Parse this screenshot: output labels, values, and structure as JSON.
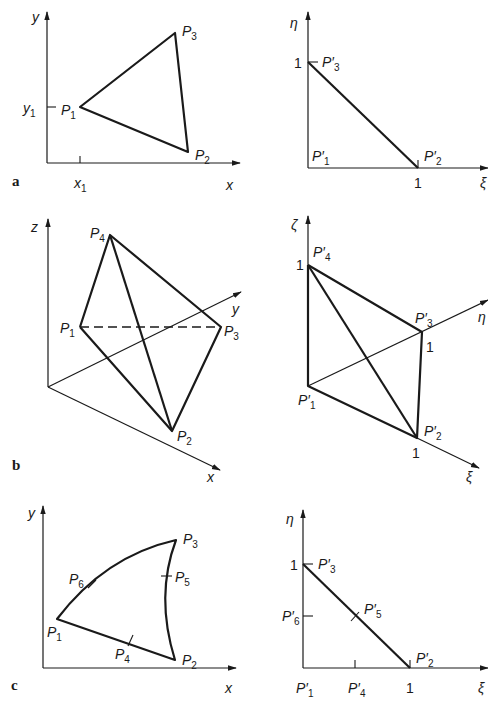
{
  "figure": {
    "panels": [
      {
        "id": "a",
        "label": "a",
        "left": {
          "axes": {
            "x": "x",
            "y": "y"
          },
          "ticks": {
            "x1": "x",
            "x1_sub": "1",
            "y1": "y",
            "y1_sub": "1"
          },
          "points": [
            {
              "name": "P",
              "sub": "1"
            },
            {
              "name": "P",
              "sub": "2"
            },
            {
              "name": "P",
              "sub": "3"
            }
          ]
        },
        "right": {
          "axes": {
            "xi": "ξ",
            "eta": "η"
          },
          "ticks": {
            "xi_one": "1",
            "eta_one": "1"
          },
          "points": [
            {
              "name": "P′",
              "sub": "1"
            },
            {
              "name": "P′",
              "sub": "2"
            },
            {
              "name": "P′",
              "sub": "3"
            }
          ]
        }
      },
      {
        "id": "b",
        "label": "b",
        "left": {
          "axes": {
            "x": "x",
            "y": "y",
            "z": "z"
          },
          "points": [
            {
              "name": "P",
              "sub": "1"
            },
            {
              "name": "P",
              "sub": "2"
            },
            {
              "name": "P",
              "sub": "3"
            },
            {
              "name": "P",
              "sub": "4"
            }
          ]
        },
        "right": {
          "axes": {
            "xi": "ξ",
            "eta": "η",
            "zeta": "ζ"
          },
          "ticks": {
            "xi_one": "1",
            "eta_one": "1",
            "zeta_one": "1"
          },
          "points": [
            {
              "name": "P′",
              "sub": "1"
            },
            {
              "name": "P′",
              "sub": "2"
            },
            {
              "name": "P′",
              "sub": "3"
            },
            {
              "name": "P′",
              "sub": "4"
            }
          ]
        }
      },
      {
        "id": "c",
        "label": "c",
        "left": {
          "axes": {
            "x": "x",
            "y": "y"
          },
          "points": [
            {
              "name": "P",
              "sub": "1"
            },
            {
              "name": "P",
              "sub": "2"
            },
            {
              "name": "P",
              "sub": "3"
            },
            {
              "name": "P",
              "sub": "4"
            },
            {
              "name": "P",
              "sub": "5"
            },
            {
              "name": "P",
              "sub": "6"
            }
          ]
        },
        "right": {
          "axes": {
            "xi": "ξ",
            "eta": "η"
          },
          "ticks": {
            "xi_one": "1",
            "eta_one": "1"
          },
          "points": [
            {
              "name": "P′",
              "sub": "1"
            },
            {
              "name": "P′",
              "sub": "2"
            },
            {
              "name": "P′",
              "sub": "3"
            },
            {
              "name": "P′",
              "sub": "4"
            },
            {
              "name": "P′",
              "sub": "5"
            },
            {
              "name": "P′",
              "sub": "6"
            }
          ]
        }
      }
    ]
  }
}
